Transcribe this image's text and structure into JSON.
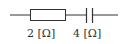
{
  "diagram": {
    "type": "circuit",
    "components": [
      {
        "kind": "resistor",
        "label": "2 [Ω]"
      },
      {
        "kind": "capacitor",
        "label": "4 [Ω]"
      }
    ]
  },
  "colors": {
    "stroke": "#333333",
    "background": "#ffffff"
  }
}
